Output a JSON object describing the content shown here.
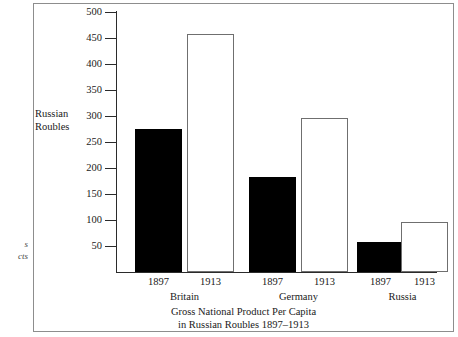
{
  "margin_note": {
    "line1": "s",
    "line2": "cts"
  },
  "axis": {
    "y_title_line1": "Russian",
    "y_title_line2": "Roubles",
    "y_ticks": [
      "500",
      "450",
      "400",
      "350",
      "300",
      "250",
      "200",
      "150",
      "100",
      "50"
    ]
  },
  "caption": {
    "line1": "Gross National Product Per Capita",
    "line2": "in Russian Roubles 1897–1913"
  },
  "colors": {
    "bar_1897": "#000000",
    "bar_1913": "#ffffff",
    "bar_1913_outline": "#6f6f6f",
    "axis": "#2b2b2b",
    "frame": "#8d8d8d"
  },
  "chart_data": {
    "type": "bar",
    "title": "Gross National Product Per Capita in Russian Roubles 1897–1913",
    "xlabel": "",
    "ylabel": "Russian Roubles",
    "ylim": [
      0,
      500
    ],
    "ytick_step": 50,
    "grid": false,
    "legend": "none",
    "categories": [
      "Britain",
      "Germany",
      "Russia"
    ],
    "series": [
      {
        "name": "1897",
        "values": [
          275,
          182,
          58
        ],
        "style": "filled-black"
      },
      {
        "name": "1913",
        "values": [
          458,
          297,
          97
        ],
        "style": "hollow-white"
      }
    ],
    "bars": [
      {
        "group": "Britain",
        "year": "1897",
        "value": 275
      },
      {
        "group": "Britain",
        "year": "1913",
        "value": 458
      },
      {
        "group": "Germany",
        "year": "1897",
        "value": 182
      },
      {
        "group": "Germany",
        "year": "1913",
        "value": 297
      },
      {
        "group": "Russia",
        "year": "1897",
        "value": 58
      },
      {
        "group": "Russia",
        "year": "1913",
        "value": 97
      }
    ]
  }
}
